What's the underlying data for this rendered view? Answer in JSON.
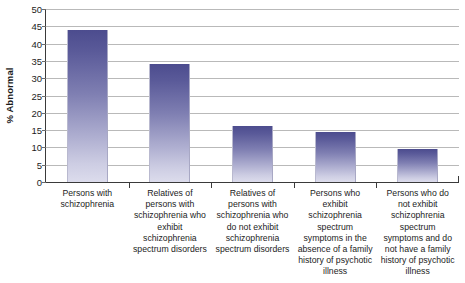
{
  "chart_data": {
    "type": "bar",
    "title": "",
    "subtitle": "",
    "xlabel": "",
    "ylabel": "% Abnormal",
    "ylim": [
      0,
      50
    ],
    "ytick_step": 5,
    "yticks": [
      50,
      45,
      40,
      35,
      30,
      25,
      20,
      15,
      10,
      5,
      0
    ],
    "grid": true,
    "legend": false,
    "legend_position": "none",
    "categories": [
      "Persons with schizophrenia",
      "Relatives of persons with schizophrenia who exhibit schizophrenia spectrum disorders",
      "Relatives of persons with schizophrenia who do not exhibit schizophrenia spectrum disorders",
      "Persons who exhibit schizophrenia spectrum symptoms in the absence of a family history of psychotic illness",
      "Persons who do not exhibit schizophrenia spectrum symptoms and do not have a family history of psychotic illness"
    ],
    "values": [
      44,
      34,
      16.3,
      14.4,
      9.5
    ],
    "bar_color_top": "#4c4c8e",
    "bar_color_bottom": "#dcdcec",
    "gridline_color": "#b9b9b9",
    "axis_color": "#3a3a3a",
    "text_color": "#1c1c1c"
  },
  "axis": {
    "y_title": "% Abnormal"
  }
}
